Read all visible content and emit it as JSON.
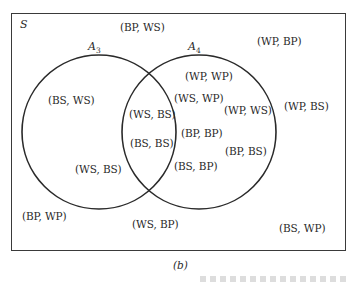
{
  "figure": {
    "caption": "(b)",
    "universe_label": "S",
    "sets": [
      {
        "name": "A",
        "subscript": "3"
      },
      {
        "name": "A",
        "subscript": "4"
      }
    ],
    "regions": {
      "outside": [
        "(BP, WS)",
        "(WP, BP)",
        "(WP, BS)",
        "(BP, WP)",
        "(WS, BP)",
        "(BS, WP)"
      ],
      "A3_only": [
        "(BS, WS)",
        "(WS, BS)"
      ],
      "intersection": [
        "(WS, BS)",
        "(BS, BS)"
      ],
      "A4_only": [
        "(WP, WP)",
        "(WS, WP)",
        "(WP, WS)",
        "(BP, BP)",
        "(BP, BS)",
        "(BS, BP)"
      ]
    }
  }
}
